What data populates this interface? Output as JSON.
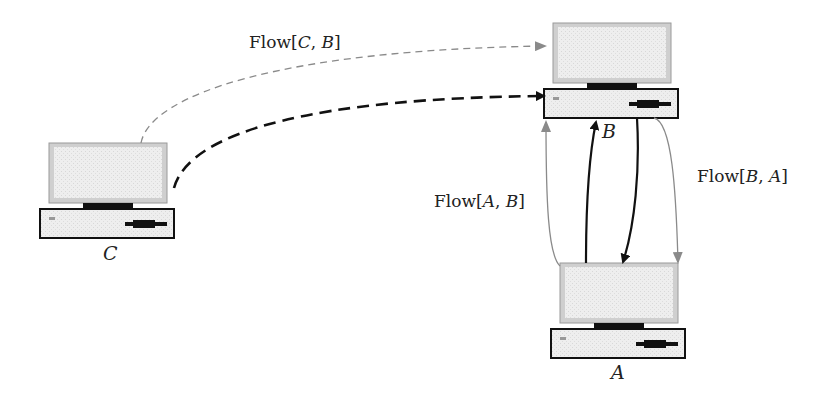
{
  "diagram": {
    "type": "network-flow",
    "nodes": [
      {
        "id": "C",
        "label": "C"
      },
      {
        "id": "B",
        "label": "B"
      },
      {
        "id": "A",
        "label": "A"
      }
    ],
    "edges": [
      {
        "from": "C",
        "to": "B",
        "style": "gray-thin-dashed",
        "label": "Flow[C, B]"
      },
      {
        "from": "C",
        "to": "B",
        "style": "black-thick-dashed",
        "label": ""
      },
      {
        "from": "A",
        "to": "B",
        "style": "gray-thin-solid",
        "label": "Flow[A, B]"
      },
      {
        "from": "A",
        "to": "B",
        "style": "black-solid",
        "label": ""
      },
      {
        "from": "B",
        "to": "A",
        "style": "black-solid",
        "label": ""
      },
      {
        "from": "B",
        "to": "A",
        "style": "gray-thin-solid",
        "label": "Flow[B, A]"
      }
    ],
    "labels": {
      "flow_cb": {
        "prefix": "Flow[",
        "a": "C",
        "sep": ", ",
        "b": "B",
        "suffix": "]"
      },
      "flow_ab": {
        "prefix": "Flow[",
        "a": "A",
        "sep": ", ",
        "b": "B",
        "suffix": "]"
      },
      "flow_ba": {
        "prefix": "Flow[",
        "a": "B",
        "sep": ", ",
        "b": "A",
        "suffix": "]"
      }
    },
    "colors": {
      "dark": "#111111",
      "gray": "#8a8a8a",
      "screen": "#ececec",
      "case": "#e6e6e6"
    }
  }
}
